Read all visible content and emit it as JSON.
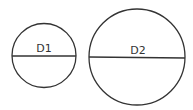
{
  "diagram": {
    "circles": [
      {
        "id": "small",
        "label": "D1",
        "cx": 44,
        "cy": 55.5,
        "r": 32
      },
      {
        "id": "large",
        "label": "D2",
        "cx": 137,
        "cy": 57,
        "r": 48
      }
    ],
    "stroke_color": "#333333",
    "background": "#ffffff"
  }
}
